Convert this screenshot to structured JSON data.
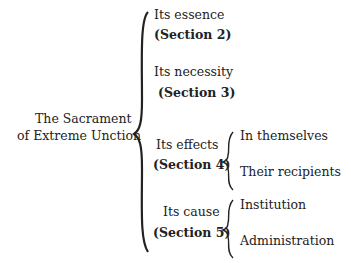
{
  "root": {
    "line1": "The Sacrament",
    "line2": "of Extreme Unction"
  },
  "branches": [
    {
      "label": "Its essence",
      "section": "(Section 2)",
      "children": []
    },
    {
      "label": "Its necessity",
      "section": "(Section 3)",
      "children": []
    },
    {
      "label": "Its effects",
      "section": "(Section 4)",
      "children": [
        "In themselves",
        "Their recipients"
      ]
    },
    {
      "label": "Its cause",
      "section": "(Section 5)",
      "children": [
        "Institution",
        "Administration"
      ]
    }
  ],
  "colors": {
    "text": "#222222",
    "background": "#ffffff"
  }
}
